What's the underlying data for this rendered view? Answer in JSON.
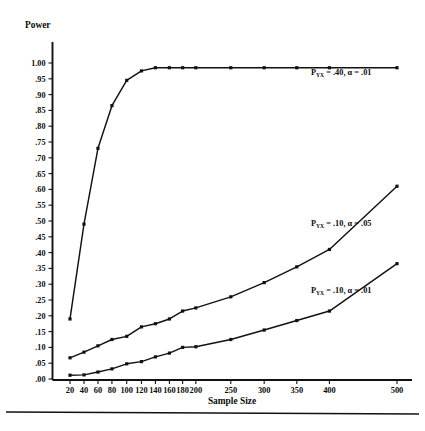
{
  "figure": {
    "y_axis_title": "Power",
    "x_axis_title": "Sample Size",
    "y_tick_labels": [
      "1.00",
      ".95",
      ".90",
      ".85",
      ".80",
      ".75",
      ".70",
      ".65",
      ".60",
      ".55",
      ".50",
      ".45",
      ".40",
      ".35",
      ".30",
      ".25",
      ".20",
      ".15",
      ".10",
      ".05",
      ".00"
    ],
    "x_tick_labels": [
      "20",
      "40",
      "60",
      "80",
      "100",
      "120",
      "140",
      "160",
      "180",
      "200",
      "250",
      "300",
      "350",
      "400",
      "500"
    ]
  },
  "series_labels": {
    "top": {
      "prefix": "P",
      "sub": "YX",
      "rest": " = .40, α = .01",
      "full": "P_YX = .40, α = .01"
    },
    "middle": {
      "prefix": "P",
      "sub": "YX",
      "rest": " = .10, α = .05",
      "full": "P_YX = .10, α = .05"
    },
    "bottom": {
      "prefix": "P",
      "sub": "YX",
      "rest": " = .10, α = .01",
      "full": "P_YX = .10, α = .01"
    }
  },
  "colors": {
    "line": "#111111",
    "marker": "#111111",
    "background": "#ffffff",
    "text": "#0b0b0b"
  },
  "chart_data": {
    "type": "line",
    "title": "",
    "xlabel": "Sample Size",
    "ylabel": "Power",
    "xlim": [
      20,
      500
    ],
    "ylim": [
      0.0,
      1.0
    ],
    "grid": false,
    "legend_position": "inline-right-of-curve",
    "x": [
      20,
      40,
      60,
      80,
      100,
      120,
      140,
      160,
      180,
      200,
      250,
      300,
      350,
      400,
      500
    ],
    "series": [
      {
        "name": "P_YX = .40, α = .01",
        "marker": "square",
        "values": [
          0.19,
          0.49,
          0.73,
          0.865,
          0.945,
          0.975,
          0.985,
          0.985,
          0.985,
          0.985,
          0.985,
          0.985,
          0.985,
          0.985,
          0.985
        ]
      },
      {
        "name": "P_YX = .10, α = .05",
        "marker": "square",
        "values": [
          0.067,
          0.085,
          0.105,
          0.125,
          0.135,
          0.165,
          0.175,
          0.19,
          0.215,
          0.225,
          0.26,
          0.305,
          0.355,
          0.41,
          0.61
        ]
      },
      {
        "name": "P_YX = .10, α = .01",
        "marker": "square",
        "values": [
          0.012,
          0.013,
          0.022,
          0.032,
          0.048,
          0.055,
          0.07,
          0.082,
          0.1,
          0.102,
          0.125,
          0.155,
          0.185,
          0.215,
          0.365
        ]
      }
    ]
  }
}
